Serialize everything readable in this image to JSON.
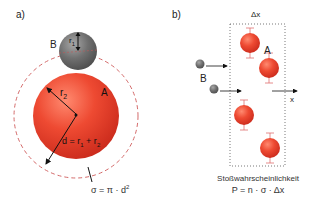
{
  "panel_a": {
    "label": "a)",
    "sphere_b": {
      "label": "B",
      "radius_label": "r",
      "radius_sub": "1",
      "color": "#6e6e6e"
    },
    "sphere_a": {
      "label": "A",
      "radius_label": "r",
      "radius_sub": "2",
      "color": "#e8402c"
    },
    "distance_label": "d = r",
    "distance_sub1": "1",
    "distance_plus": " + r",
    "distance_sub2": "2",
    "cross_section_formula": "σ = π · d",
    "cross_section_exp": "2",
    "dashed_circle_color": "#d46a6a"
  },
  "panel_b": {
    "label": "b)",
    "box_width_label": "Δx",
    "particle_a_label": "A",
    "particle_b_label": "B",
    "axis_label": "x",
    "caption_title": "Stoßwahrscheinlichkeit",
    "caption_formula": "P = n · σ · Δx"
  }
}
